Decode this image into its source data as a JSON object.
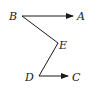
{
  "diagram": {
    "points": {
      "A": {
        "label": "A",
        "x": 73,
        "y": 16
      },
      "B": {
        "label": "B",
        "x": 22,
        "y": 16
      },
      "C": {
        "label": "C",
        "x": 68,
        "y": 76
      },
      "D": {
        "label": "D",
        "x": 39,
        "y": 76
      },
      "E": {
        "label": "E",
        "x": 58,
        "y": 43
      }
    },
    "segments": [
      {
        "from": "B",
        "to": "A",
        "arrow": true
      },
      {
        "from": "B",
        "to": "E",
        "arrow": false
      },
      {
        "from": "E",
        "to": "D",
        "arrow": false
      },
      {
        "from": "D",
        "to": "C",
        "arrow": true
      }
    ],
    "colors": {
      "stroke": "#1a1a1a",
      "background": "#ffffff"
    }
  }
}
